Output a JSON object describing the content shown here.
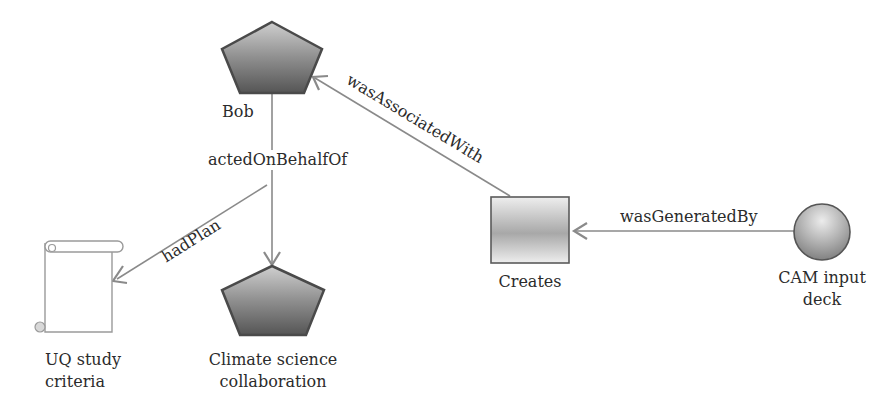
{
  "diagram": {
    "type": "provenance-graph",
    "nodes": [
      {
        "id": "bob",
        "label": "Bob",
        "shape": "pentagon",
        "kind": "agent"
      },
      {
        "id": "climate",
        "label_lines": [
          "Climate science",
          "collaboration"
        ],
        "shape": "pentagon",
        "kind": "agent"
      },
      {
        "id": "uq",
        "label_lines": [
          "UQ study",
          "criteria"
        ],
        "shape": "scroll",
        "kind": "plan"
      },
      {
        "id": "creates",
        "label": "Creates",
        "shape": "square",
        "kind": "activity"
      },
      {
        "id": "cam",
        "label_lines": [
          "CAM input",
          "deck"
        ],
        "shape": "circle",
        "kind": "entity"
      }
    ],
    "edges": [
      {
        "from": "bob",
        "to": "climate",
        "label": "actedOnBehalfOf"
      },
      {
        "from": "bob",
        "to": "uq",
        "label": "hadPlan"
      },
      {
        "from": "creates",
        "to": "bob",
        "label": "wasAssociatedWith"
      },
      {
        "from": "cam",
        "to": "creates",
        "label": "wasGeneratedBy"
      }
    ]
  },
  "colors": {
    "edge": "#8a8a8a",
    "shape_stroke": "#4a4a4a",
    "pentagon_fill_top": "#c8c8c8",
    "pentagon_fill_bottom": "#5a5a5a",
    "square_fill_mid": "#a9a9a9",
    "circle_fill": "#9a9a9a"
  }
}
